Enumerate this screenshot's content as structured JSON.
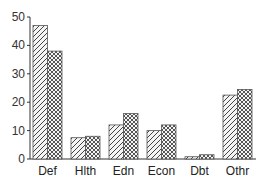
{
  "chart_data": {
    "type": "bar",
    "title": "",
    "xlabel": "",
    "ylabel": "",
    "categories": [
      "Def",
      "Hlth",
      "Edn",
      "Econ",
      "Dbt",
      "Othr"
    ],
    "series": [
      {
        "name": "Series 1",
        "pattern": "diagonal-hatch",
        "values": [
          47,
          7.5,
          12,
          10,
          0.8,
          22.5
        ]
      },
      {
        "name": "Series 2",
        "pattern": "crosshatch",
        "values": [
          38,
          8,
          16,
          12,
          1.5,
          24.5
        ]
      }
    ],
    "ylim": [
      0,
      50
    ],
    "yticks": [
      0,
      10,
      20,
      30,
      40,
      50
    ],
    "grid": false,
    "legend": "none"
  },
  "colors": {
    "axis": "#333333",
    "bar_fill": "#ffffff",
    "bar_stroke": "#555555",
    "hatch": "#444444"
  }
}
